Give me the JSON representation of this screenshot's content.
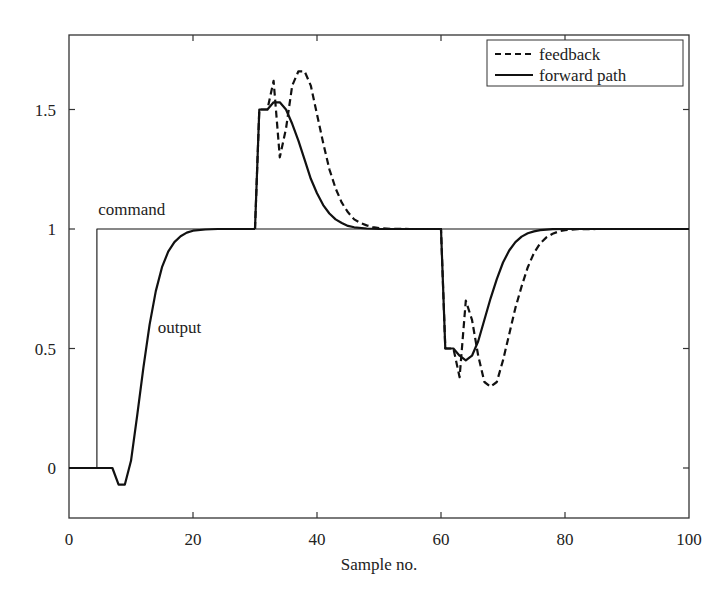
{
  "chart_data": {
    "type": "line",
    "title": "",
    "xlabel": "Sample no.",
    "ylabel": "",
    "xlim": [
      0,
      100
    ],
    "ylim": [
      -0.2,
      1.82
    ],
    "xticks": [
      0,
      20,
      40,
      60,
      80,
      100
    ],
    "xtick_labels": [
      "0",
      "20",
      "40",
      "60",
      "80",
      "100"
    ],
    "yticks": [
      0,
      0.5,
      1,
      1.5
    ],
    "ytick_labels": [
      "0",
      "0.5",
      "1",
      "1.5"
    ],
    "grid": false,
    "legend": {
      "position": "upper right",
      "entries": [
        {
          "label": "feedback",
          "style": "dashed"
        },
        {
          "label": "forward path",
          "style": "solid"
        }
      ]
    },
    "annotations": [
      {
        "text": "command",
        "x": 6,
        "y": 1.08
      },
      {
        "text": "output",
        "x": 14,
        "y": 0.6
      }
    ],
    "series": [
      {
        "name": "command",
        "style": "thin-solid",
        "x": [
          0,
          4.5,
          4.5,
          100
        ],
        "y": [
          0,
          0,
          1,
          1
        ]
      },
      {
        "name": "output (initial step)",
        "style": "solid",
        "x": [
          0,
          7,
          8,
          9,
          10,
          11,
          12,
          13,
          14,
          15,
          16,
          17,
          18,
          19,
          20,
          22,
          24,
          26,
          28,
          30
        ],
        "y": [
          0,
          0,
          -0.07,
          -0.07,
          0.03,
          0.22,
          0.42,
          0.6,
          0.74,
          0.84,
          0.905,
          0.945,
          0.97,
          0.985,
          0.993,
          0.998,
          1.0,
          1.0,
          1.0,
          1.0
        ]
      },
      {
        "name": "forward path",
        "style": "solid",
        "x": [
          30,
          30.7,
          32,
          33,
          34,
          35,
          36,
          37,
          38,
          39,
          40,
          41,
          42,
          43,
          44,
          45,
          46,
          48,
          50,
          55,
          60,
          60.7,
          62,
          63,
          64,
          65,
          66,
          67,
          68,
          69,
          70,
          71,
          72,
          73,
          74,
          75,
          76,
          78,
          80,
          85,
          100
        ],
        "y": [
          1.0,
          1.5,
          1.5,
          1.53,
          1.53,
          1.5,
          1.44,
          1.37,
          1.29,
          1.21,
          1.15,
          1.1,
          1.065,
          1.04,
          1.025,
          1.013,
          1.007,
          1.002,
          1.0,
          1.0,
          1.0,
          0.5,
          0.5,
          0.47,
          0.45,
          0.47,
          0.53,
          0.62,
          0.71,
          0.79,
          0.86,
          0.91,
          0.945,
          0.968,
          0.982,
          0.99,
          0.995,
          0.999,
          1.0,
          1.0,
          1.0
        ]
      },
      {
        "name": "feedback",
        "style": "dashed",
        "x": [
          30,
          30.7,
          32,
          33,
          34,
          35,
          36,
          37,
          38,
          39,
          40,
          41,
          42,
          43,
          44,
          45,
          46,
          47,
          48,
          49,
          50,
          52,
          55,
          60,
          60.7,
          62,
          63,
          64,
          65,
          66,
          67,
          68,
          69,
          70,
          71,
          72,
          73,
          74,
          75,
          76,
          77,
          78,
          79,
          80,
          82,
          85,
          100
        ],
        "y": [
          1.0,
          1.5,
          1.5,
          1.62,
          1.3,
          1.42,
          1.6,
          1.66,
          1.66,
          1.6,
          1.48,
          1.36,
          1.25,
          1.17,
          1.11,
          1.07,
          1.04,
          1.025,
          1.015,
          1.008,
          1.004,
          1.001,
          1.0,
          1.0,
          0.5,
          0.5,
          0.38,
          0.7,
          0.62,
          0.47,
          0.36,
          0.34,
          0.36,
          0.45,
          0.56,
          0.67,
          0.76,
          0.84,
          0.9,
          0.94,
          0.965,
          0.98,
          0.99,
          0.995,
          0.999,
          1.0,
          1.0
        ]
      }
    ]
  }
}
